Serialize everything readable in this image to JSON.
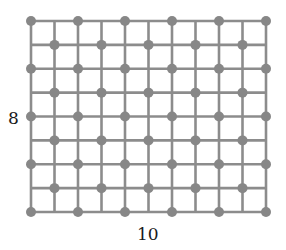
{
  "diagram": {
    "type": "grid",
    "columns": 10,
    "rows": 8,
    "origin": {
      "x": 31,
      "y": 21
    },
    "cell_width": 23.5,
    "cell_height": 23.875,
    "line_color": "#8c8c8c",
    "line_width": 2.6,
    "dot_color": "#878787",
    "dot_radius": 5,
    "dot_rule": "checkerboard: dot at intersection where (col+row) is even",
    "labels": {
      "height": "8",
      "width": "10"
    }
  }
}
